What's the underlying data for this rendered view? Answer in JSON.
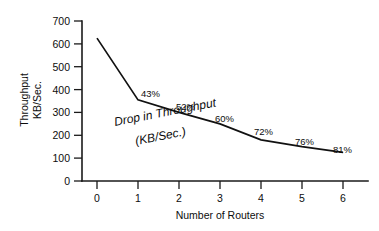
{
  "chart_data": {
    "type": "line",
    "title": "",
    "xlabel": "Number of Routers",
    "ylabel_line1": "Throughput",
    "ylabel_line2": "KB/Sec.",
    "x": [
      0,
      1,
      2,
      3,
      4,
      5,
      6
    ],
    "xticklabels": [
      "0",
      "1",
      "2",
      "3",
      "4",
      "5",
      "6"
    ],
    "yticklabels": [
      "0",
      "100",
      "200",
      "300",
      "400",
      "500",
      "600",
      "700"
    ],
    "yticks": [
      0,
      100,
      200,
      300,
      400,
      500,
      600,
      700
    ],
    "xlim": [
      0,
      6
    ],
    "ylim": [
      0,
      700
    ],
    "grid": false,
    "legend": "none",
    "series": [
      {
        "name": "Throughput",
        "values": [
          625,
          355,
          300,
          250,
          180,
          150,
          125
        ]
      }
    ],
    "annotations": [
      {
        "text": "43%",
        "x": 1,
        "y": 400
      },
      {
        "text": "52%",
        "x": 2,
        "y": 345
      },
      {
        "text": "60%",
        "x": 3,
        "y": 300
      },
      {
        "text": "72%",
        "x": 4,
        "y": 235
      },
      {
        "text": "76%",
        "x": 5,
        "y": 205
      },
      {
        "text": "81%",
        "x": 6,
        "y": 180
      }
    ],
    "curve_annotation_line1": "Drop in Throughput",
    "curve_annotation_line2": "(KB/Sec.)"
  }
}
